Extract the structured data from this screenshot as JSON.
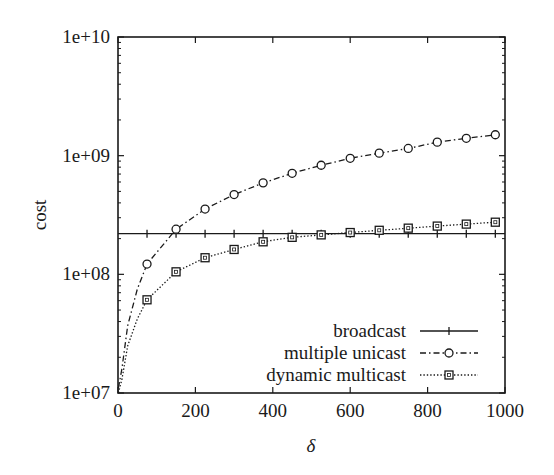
{
  "chart_data": {
    "type": "line",
    "title": "",
    "xlabel": "δ",
    "ylabel": "cost",
    "xlim": [
      0,
      1000
    ],
    "ylim": [
      10000000.0,
      10000000000.0
    ],
    "yscale": "log",
    "grid": false,
    "legend_position": "lower right (inside)",
    "x_ticks": [
      "0",
      "200",
      "400",
      "600",
      "800",
      "1000"
    ],
    "x_tick_values": [
      0,
      200,
      400,
      600,
      800,
      1000
    ],
    "y_ticks": [
      "1e+07",
      "1e+08",
      "1e+09",
      "1e+10"
    ],
    "y_tick_values": [
      10000000.0,
      100000000.0,
      1000000000.0,
      10000000000.0
    ],
    "marker_x": [
      75,
      150,
      225,
      300,
      375,
      450,
      525,
      600,
      675,
      750,
      825,
      900,
      975
    ],
    "series": [
      {
        "name": "broadcast",
        "style": "solid",
        "marker": "plus",
        "x": [
          0,
          75,
          150,
          225,
          300,
          375,
          450,
          525,
          600,
          675,
          750,
          825,
          900,
          975,
          1000
        ],
        "values": [
          220000000.0,
          220000000.0,
          220000000.0,
          220000000.0,
          220000000.0,
          220000000.0,
          220000000.0,
          220000000.0,
          220000000.0,
          220000000.0,
          220000000.0,
          220000000.0,
          220000000.0,
          220000000.0,
          220000000.0
        ]
      },
      {
        "name": "multiple unicast",
        "style": "dash-dot",
        "marker": "circle",
        "x": [
          1,
          10,
          25,
          50,
          75,
          150,
          225,
          300,
          375,
          450,
          525,
          600,
          675,
          750,
          825,
          900,
          975
        ],
        "values": [
          11000000.0,
          16000000.0,
          37000000.0,
          75000000.0,
          122000000.0,
          240000000.0,
          355000000.0,
          470000000.0,
          590000000.0,
          710000000.0,
          830000000.0,
          950000000.0,
          1050000000.0,
          1150000000.0,
          1300000000.0,
          1400000000.0,
          1500000000.0
        ]
      },
      {
        "name": "dynamic multicast",
        "style": "dotted",
        "marker": "square",
        "x": [
          1,
          10,
          25,
          50,
          75,
          150,
          225,
          300,
          375,
          450,
          525,
          600,
          675,
          750,
          825,
          900,
          975
        ],
        "values": [
          10000000.0,
          13000000.0,
          25000000.0,
          42000000.0,
          61000000.0,
          105000000.0,
          138000000.0,
          162000000.0,
          188000000.0,
          205000000.0,
          215000000.0,
          225000000.0,
          235000000.0,
          245000000.0,
          255000000.0,
          265000000.0,
          275000000.0
        ]
      }
    ]
  },
  "legend": {
    "items": [
      {
        "label": "broadcast"
      },
      {
        "label": "multiple unicast"
      },
      {
        "label": "dynamic multicast"
      }
    ]
  },
  "colors": {
    "line": "#1a1a1a",
    "background": "#ffffff"
  }
}
